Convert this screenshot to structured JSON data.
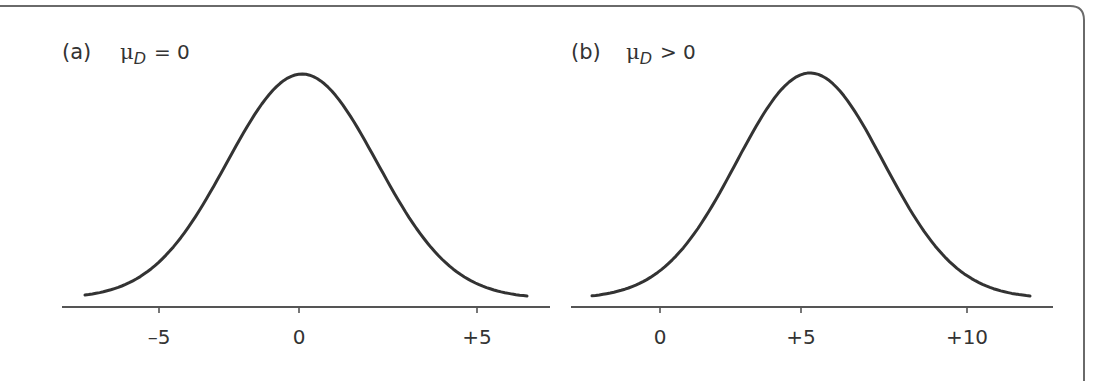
{
  "frame": {
    "stroke": "#6a6a6a"
  },
  "chart_data": [
    {
      "type": "line",
      "title": "(a)",
      "annotation": {
        "symbol": "μ",
        "subscript": "D",
        "relation": "= 0"
      },
      "panel_label": "(a)",
      "xlabel": "",
      "ylabel": "",
      "distribution": "normal",
      "mean": 0,
      "sd": 2.3,
      "xlim": [
        -7.5,
        6.5
      ],
      "x_ticks": [
        -5,
        0,
        5
      ],
      "x_tick_labels": [
        "–5",
        "0",
        "+5"
      ],
      "x_tick_px": [
        159,
        299,
        477
      ],
      "axis_px": {
        "x0": 62,
        "x1": 550,
        "y": 307
      },
      "curve_px": {
        "x_start": 85,
        "x_end": 527,
        "peak_x": 302,
        "peak_y": 74,
        "base_y": 296
      },
      "grid": false,
      "legend": null
    },
    {
      "type": "line",
      "title": "(b)",
      "annotation": {
        "symbol": "μ",
        "subscript": "D",
        "relation": "> 0"
      },
      "panel_label": "(b)",
      "xlabel": "",
      "ylabel": "",
      "distribution": "normal",
      "mean": 5,
      "sd": 2.3,
      "xlim": [
        -3,
        12
      ],
      "x_ticks": [
        0,
        5,
        10
      ],
      "x_tick_labels": [
        "0",
        "+5",
        "+10"
      ],
      "x_tick_px": [
        660,
        801,
        967
      ],
      "axis_px": {
        "x0": 571,
        "x1": 1053,
        "y": 307
      },
      "curve_px": {
        "x_start": 592,
        "x_end": 1030,
        "peak_x": 810,
        "peak_y": 73,
        "base_y": 296
      },
      "grid": false,
      "legend": null
    }
  ]
}
